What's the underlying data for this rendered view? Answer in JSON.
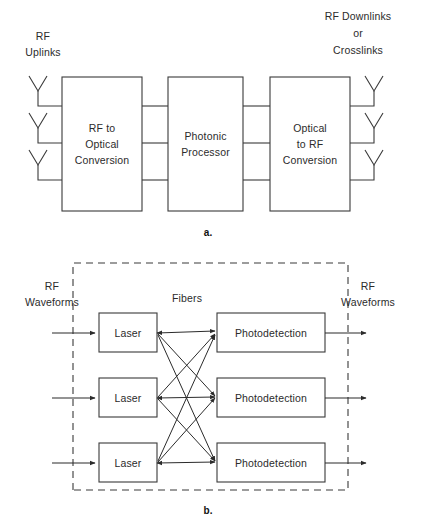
{
  "figure": {
    "panels": [
      {
        "id": "a",
        "caption": "a.",
        "labels": {
          "left_line1": "RF",
          "left_line2": "Uplinks",
          "right_line1": "RF Downlinks",
          "right_line2": "or",
          "right_line3": "Crosslinks"
        },
        "blocks": [
          {
            "id": "rf-to-optical",
            "line1": "RF to",
            "line2": "Optical",
            "line3": "Conversion"
          },
          {
            "id": "photonic-processor",
            "line1": "Photonic",
            "line2": "Processor",
            "line3": ""
          },
          {
            "id": "optical-to-rf",
            "line1": "Optical",
            "line2": "to RF",
            "line3": "Conversion"
          }
        ],
        "antenna_count_left": 3,
        "antenna_count_right": 3,
        "interconnect_count": 3
      },
      {
        "id": "b",
        "caption": "b.",
        "labels": {
          "left_line1": "RF",
          "left_line2": "Waveforms",
          "center": "Fibers",
          "right_line1": "RF",
          "right_line2": "Waveforms"
        },
        "rows": [
          {
            "source": "Laser",
            "sink": "Photodetection"
          },
          {
            "source": "Laser",
            "sink": "Photodetection"
          },
          {
            "source": "Laser",
            "sink": "Photodetection"
          }
        ],
        "fiber_links": 9
      }
    ]
  },
  "colors": {
    "ink": "#2b2b2b",
    "line": "#3a3a3a",
    "background": "#ffffff"
  }
}
